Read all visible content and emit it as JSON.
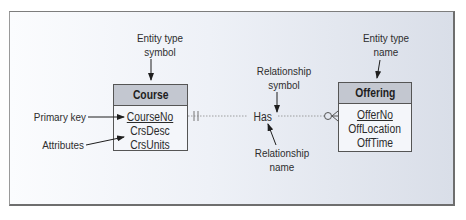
{
  "diagram": {
    "entities": [
      {
        "name": "Course",
        "primary_key": "CourseNo",
        "attributes": [
          "CourseNo",
          "CrsDesc",
          "CrsUnits"
        ]
      },
      {
        "name": "Offering",
        "primary_key": "OfferNo",
        "attributes": [
          "OfferNo",
          "OffLocation",
          "OffTime"
        ]
      }
    ],
    "relationship": {
      "name": "Has",
      "from": "Course",
      "to": "Offering",
      "from_cardinality": "one-and-only-one",
      "to_cardinality": "zero-or-many"
    },
    "callouts": {
      "entity_type_symbol": [
        "Entity type",
        "symbol"
      ],
      "entity_type_name": [
        "Entity type",
        "name"
      ],
      "relationship_symbol": [
        "Relationship",
        "symbol"
      ],
      "relationship_name": [
        "Relationship",
        "name"
      ],
      "primary_key": "Primary key",
      "attributes": "Attributes"
    },
    "colors": {
      "header_fill": "#c3c7d0",
      "box_fill": "#f4f6fa",
      "line": "#555555",
      "panel_gradient_left": "#fbfcfe",
      "panel_gradient_right": "#d9dee8"
    }
  }
}
